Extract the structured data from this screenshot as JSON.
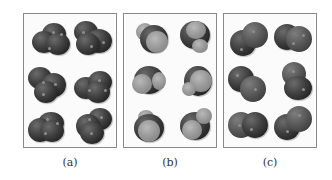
{
  "figure": {
    "panels": [
      {
        "id": "a",
        "label": "(a)",
        "description": "six dark trimer-like molecules (space-filling)",
        "molecule_count": 6,
        "shade": "dark"
      },
      {
        "id": "b",
        "label": "(b)",
        "description": "six molecules with dark central atom and light spheres",
        "molecule_count": 6,
        "shade": "mixed"
      },
      {
        "id": "c",
        "label": "(c)",
        "description": "six dark diatomic molecules",
        "molecule_count": 6,
        "shade": "dark"
      }
    ]
  },
  "colors": {
    "border": "#8a8a8a",
    "dark_atom": "#2e2e2e",
    "light_atom": "#9a9a9a",
    "background": "#ffffff"
  }
}
